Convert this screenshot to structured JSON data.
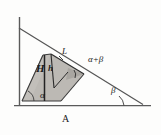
{
  "figure": {
    "colors": {
      "line": "#4d4d4d",
      "line_dark": "#2b2b2b",
      "fill_shaded": "#b9b6b1",
      "fill_shaded_light": "#c4c1bc",
      "background": "#fdfdfc",
      "text": "#1a1a1a"
    },
    "labels": [
      {
        "id": "H",
        "text": "H",
        "x": 37,
        "y": 70,
        "style": "lbl-H"
      },
      {
        "id": "h",
        "text": "h",
        "x": 50,
        "y": 70,
        "style": "lbl-h"
      },
      {
        "id": "L",
        "text": "L",
        "x": 61,
        "y": 53,
        "style": "lbl-L"
      },
      {
        "id": "alpha_beta",
        "text": "α+β",
        "x": 88,
        "y": 59,
        "style": "lbl-ab"
      },
      {
        "id": "alpha",
        "text": "α",
        "x": 41,
        "y": 94,
        "style": "lbl-alpha"
      },
      {
        "id": "beta",
        "text": "β",
        "x": 112,
        "y": 90,
        "style": "lbl-beta"
      },
      {
        "id": "A",
        "text": "A",
        "x": 62,
        "y": 117,
        "style": "lbl-A"
      }
    ],
    "geometry": {
      "vertical_axis": {
        "x": 19,
        "y_top": 17,
        "y_bottom": 106
      },
      "baseline": {
        "x_start": 15,
        "x_end": 151,
        "y": 106
      },
      "upper_diagonal": {
        "x1": 19,
        "y1": 28,
        "x2": 142,
        "y2": 104
      },
      "parallelogram": "22,101 42,56 51,54 76,69 84,74 60,88",
      "apex": {
        "x": 51,
        "y": 54
      },
      "inner_triangle": "51,54 51,88 66,79",
      "small_triangle": "76,69 84,74 68,81",
      "angle_arc_alpha": {
        "cx": 33,
        "cy": 101,
        "r": 11
      },
      "angle_arc_beta": {
        "cx": 126,
        "cy": 106,
        "r": 13
      },
      "angle_arc_ab": {
        "cx": 80,
        "cy": 72,
        "r": 8
      }
    }
  }
}
